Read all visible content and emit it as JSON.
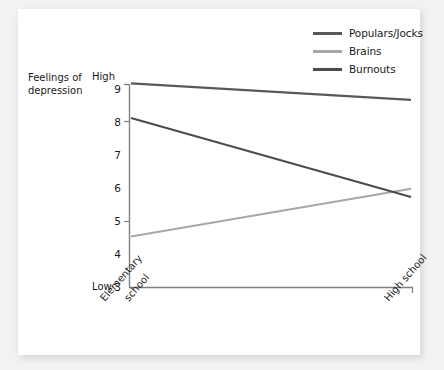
{
  "chart_data": {
    "type": "line",
    "title": "",
    "xlabel": "",
    "ylabel": "Feelings of depression",
    "ylabel_line1": "Feelings of",
    "ylabel_line2": "depression",
    "categories": [
      "Elementary school",
      "High school"
    ],
    "x": [
      0,
      1
    ],
    "ylim": [
      3,
      9
    ],
    "yticks": [
      3,
      4,
      5,
      6,
      7,
      8,
      9
    ],
    "ytick_labels": [
      "3",
      "4",
      "5",
      "6",
      "7",
      "8",
      "9"
    ],
    "y_axis_high_label": "High",
    "y_axis_low_label": "Low",
    "grid": false,
    "legend_position": "top-right",
    "series": [
      {
        "name": "Populars/Jocks",
        "values": [
          9.2,
          8.7
        ],
        "color": "#595959"
      },
      {
        "name": "Brains",
        "values": [
          4.55,
          6.0
        ],
        "color": "#a8a8a8"
      },
      {
        "name": "Burnouts",
        "values": [
          8.15,
          5.75
        ],
        "color": "#4d4d4d"
      }
    ]
  },
  "legend": {
    "items": [
      {
        "label": "Populars/Jocks",
        "color": "#595959"
      },
      {
        "label": "Brains",
        "color": "#a8a8a8"
      },
      {
        "label": "Burnouts",
        "color": "#4d4d4d"
      }
    ]
  },
  "axis": {
    "y_title_line1": "Feelings of",
    "y_title_line2": "depression",
    "high": "High",
    "low": "Low",
    "ticks": [
      "9",
      "8",
      "7",
      "6",
      "5",
      "4",
      "3"
    ],
    "x_categories": [
      "Elementary school",
      "High school"
    ],
    "x_cat_0_line1": "Elementary",
    "x_cat_0_line2": "school",
    "x_cat_1": "High school"
  },
  "colors": {
    "background": "#f2f2f2",
    "card": "#ffffff",
    "axis": "#808080",
    "text": "#1a1a1a"
  }
}
